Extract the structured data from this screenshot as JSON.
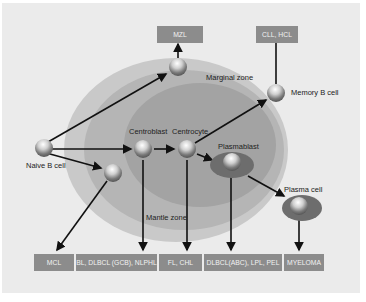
{
  "diagram": {
    "zones": {
      "marginal": "Marginal zone",
      "mantle": "Mantle zone"
    },
    "cells": {
      "naive": "Naive B cell",
      "centroblast": "Centroblast",
      "centrocyte": "Centrocyte",
      "plasmablast": "Plasmablast",
      "memory": "Memory B cell",
      "plasma": "Plasma cell"
    },
    "top_boxes": {
      "mzl": "MZL",
      "cll_hcl": "CLL, HCL"
    },
    "bottom_boxes": [
      "MCL",
      "BL, DLBCL (GCB), NLPHL",
      "FL, CHL",
      "DLBCL(ABC), LPL, PEL",
      "MYELOMA"
    ],
    "colors": {
      "background": "#ebebeb",
      "outer_zone": "#c9c9c9",
      "middle_zone": "#b3b3b3",
      "inner_zone": "#9e9e9e",
      "box": "#8c8c8c",
      "arrow": "#111111"
    }
  }
}
